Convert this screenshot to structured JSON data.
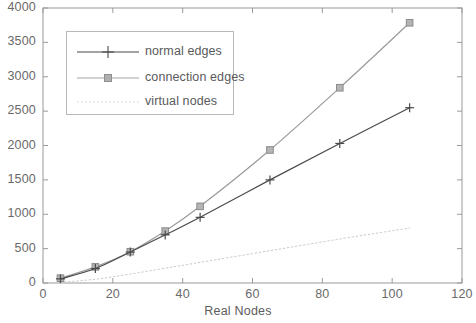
{
  "chart_data": {
    "type": "line",
    "title": "",
    "xlabel": "Real Nodes",
    "ylabel": "",
    "xlim": [
      0,
      120
    ],
    "ylim": [
      0,
      4000
    ],
    "xticks": [
      0,
      20,
      40,
      60,
      80,
      100,
      120
    ],
    "yticks": [
      0,
      500,
      1000,
      1500,
      2000,
      2500,
      3000,
      3500,
      4000
    ],
    "xtick_labels": [
      "0",
      "20",
      "40",
      "60",
      "80",
      "100",
      "120"
    ],
    "ytick_labels": [
      "0",
      "500",
      "1000",
      "1500",
      "2000",
      "2500",
      "3000",
      "3500",
      "4000"
    ],
    "grid": false,
    "legend_position": "upper-left-inside",
    "x": [
      5,
      15,
      25,
      35,
      45,
      65,
      85,
      105
    ],
    "series": [
      {
        "name": "normal edges",
        "marker": "plus",
        "linestyle": "solid",
        "color": "#4a4a4a",
        "values": [
          60,
          210,
          450,
          700,
          955,
          1500,
          2030,
          2550
        ]
      },
      {
        "name": "connection edges",
        "marker": "square",
        "linestyle": "solid",
        "color": "#9a9a9a",
        "values": [
          70,
          235,
          455,
          755,
          1115,
          1935,
          2840,
          3785
        ]
      },
      {
        "name": "virtual nodes",
        "marker": "none",
        "linestyle": "dotted",
        "color": "#c8c8c8",
        "values": [
          10,
          55,
          130,
          215,
          300,
          470,
          640,
          800
        ]
      }
    ]
  },
  "legend": {
    "entries": [
      {
        "label": "normal edges"
      },
      {
        "label": "connection edges"
      },
      {
        "label": "virtual nodes"
      }
    ]
  },
  "axis": {
    "x_title": "Real Nodes"
  }
}
